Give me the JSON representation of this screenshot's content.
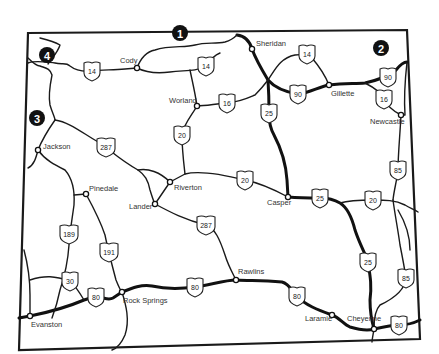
{
  "map": {
    "region": "Wyoming",
    "colors": {
      "line": "#1a1a1a",
      "background": "#ffffff",
      "callout": "#111111"
    },
    "callouts": [
      {
        "id": "1",
        "label": "1",
        "x": 180,
        "y": 33
      },
      {
        "id": "2",
        "label": "2",
        "x": 381,
        "y": 48
      },
      {
        "id": "3",
        "label": "3",
        "x": 37,
        "y": 118
      },
      {
        "id": "4",
        "label": "4",
        "x": 47,
        "y": 55
      }
    ],
    "cities": [
      {
        "name": "Sheridan",
        "x": 252,
        "y": 49,
        "lx": 256,
        "ly": 46
      },
      {
        "name": "Cody",
        "x": 137,
        "y": 68,
        "lx": 120,
        "ly": 63
      },
      {
        "name": "Worland",
        "x": 197,
        "y": 106,
        "lx": 169,
        "ly": 103
      },
      {
        "name": "Gillette",
        "x": 329,
        "y": 85,
        "lx": 331,
        "ly": 96
      },
      {
        "name": "Newcastle",
        "x": 401,
        "y": 115,
        "lx": 370,
        "ly": 124
      },
      {
        "name": "Jackson",
        "x": 38,
        "y": 150,
        "lx": 43,
        "ly": 149
      },
      {
        "name": "Pinedale",
        "x": 86,
        "y": 194,
        "lx": 89,
        "ly": 191
      },
      {
        "name": "Riverton",
        "x": 170,
        "y": 182,
        "lx": 174,
        "ly": 190
      },
      {
        "name": "Lander",
        "x": 155,
        "y": 204,
        "lx": 129,
        "ly": 209
      },
      {
        "name": "Casper",
        "x": 288,
        "y": 197,
        "lx": 267,
        "ly": 205
      },
      {
        "name": "Rawlins",
        "x": 236,
        "y": 280,
        "lx": 238,
        "ly": 274
      },
      {
        "name": "Rock Springs",
        "x": 122,
        "y": 292,
        "lx": 123,
        "ly": 303
      },
      {
        "name": "Evanston",
        "x": 30,
        "y": 316,
        "lx": 31,
        "ly": 327
      },
      {
        "name": "Laramie",
        "x": 332,
        "y": 315,
        "lx": 305,
        "ly": 321
      },
      {
        "name": "Cheyenne",
        "x": 374,
        "y": 329,
        "lx": 347,
        "ly": 321
      }
    ],
    "shields": [
      {
        "route": "14",
        "x": 92,
        "y": 71
      },
      {
        "route": "14",
        "x": 206,
        "y": 66
      },
      {
        "route": "14",
        "x": 307,
        "y": 54
      },
      {
        "route": "16",
        "x": 227,
        "y": 103
      },
      {
        "route": "90",
        "x": 298,
        "y": 94
      },
      {
        "route": "90",
        "x": 388,
        "y": 77
      },
      {
        "route": "16",
        "x": 384,
        "y": 99
      },
      {
        "route": "25",
        "x": 269,
        "y": 113
      },
      {
        "route": "20",
        "x": 182,
        "y": 135
      },
      {
        "route": "287",
        "x": 106,
        "y": 147
      },
      {
        "route": "20",
        "x": 245,
        "y": 180
      },
      {
        "route": "25",
        "x": 320,
        "y": 198
      },
      {
        "route": "20",
        "x": 373,
        "y": 200
      },
      {
        "route": "85",
        "x": 398,
        "y": 170
      },
      {
        "route": "287",
        "x": 206,
        "y": 225
      },
      {
        "route": "189",
        "x": 69,
        "y": 234
      },
      {
        "route": "191",
        "x": 109,
        "y": 252
      },
      {
        "route": "30",
        "x": 70,
        "y": 281
      },
      {
        "route": "80",
        "x": 96,
        "y": 297
      },
      {
        "route": "80",
        "x": 195,
        "y": 287
      },
      {
        "route": "25",
        "x": 368,
        "y": 262
      },
      {
        "route": "85",
        "x": 406,
        "y": 278
      },
      {
        "route": "80",
        "x": 297,
        "y": 296
      },
      {
        "route": "80",
        "x": 399,
        "y": 325
      }
    ]
  }
}
